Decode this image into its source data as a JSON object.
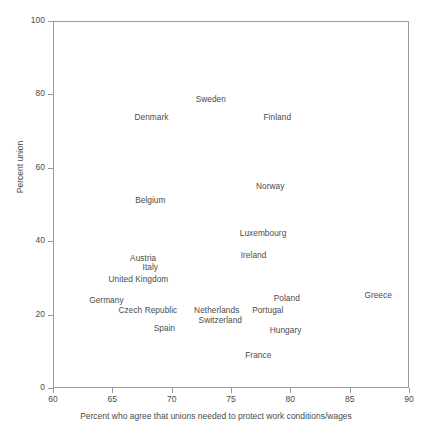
{
  "chart_data": {
    "type": "scatter",
    "title": "",
    "xlabel": "Percent who agree that unions needed to protect work conditions/wages",
    "ylabel": "Percent union",
    "xlim": [
      60,
      90
    ],
    "ylim": [
      0,
      100
    ],
    "xticks": [
      60,
      65,
      70,
      75,
      80,
      85,
      90
    ],
    "yticks": [
      0,
      20,
      40,
      60,
      80,
      100
    ],
    "grid": false,
    "legend": null,
    "marker_style": "text-label-only",
    "points": [
      {
        "label": "Sweden",
        "x": 73.3,
        "y": 78.8
      },
      {
        "label": "Denmark",
        "x": 68.3,
        "y": 73.8
      },
      {
        "label": "Finland",
        "x": 78.9,
        "y": 73.8
      },
      {
        "label": "Norway",
        "x": 78.3,
        "y": 55.0
      },
      {
        "label": "Belgium",
        "x": 68.2,
        "y": 51.2
      },
      {
        "label": "Luxembourg",
        "x": 77.7,
        "y": 42.2
      },
      {
        "label": "Ireland",
        "x": 76.9,
        "y": 36.2
      },
      {
        "label": "Austria",
        "x": 67.6,
        "y": 35.4
      },
      {
        "label": "Italy",
        "x": 68.2,
        "y": 33.0
      },
      {
        "label": "United Kingdom",
        "x": 67.2,
        "y": 29.7
      },
      {
        "label": "Germany",
        "x": 64.5,
        "y": 24.0
      },
      {
        "label": "Poland",
        "x": 79.7,
        "y": 24.5
      },
      {
        "label": "Greece",
        "x": 87.4,
        "y": 25.3
      },
      {
        "label": "Czech Republic",
        "x": 68.0,
        "y": 21.3
      },
      {
        "label": "Netherlands",
        "x": 73.8,
        "y": 21.3
      },
      {
        "label": "Portugal",
        "x": 78.1,
        "y": 21.3
      },
      {
        "label": "Switzerland",
        "x": 74.1,
        "y": 18.5
      },
      {
        "label": "Hungary",
        "x": 79.6,
        "y": 15.8
      },
      {
        "label": "Spain",
        "x": 69.4,
        "y": 16.4
      },
      {
        "label": "France",
        "x": 77.3,
        "y": 9.0
      }
    ]
  },
  "axes": {
    "y_tick_labels": [
      "100",
      "80",
      "60",
      "40",
      "20",
      "0"
    ],
    "y_tick_values": [
      100,
      80,
      60,
      40,
      20,
      0
    ],
    "x_tick_labels": [
      "60",
      "65",
      "70",
      "75",
      "80",
      "85",
      "90"
    ],
    "x_tick_values": [
      60,
      65,
      70,
      75,
      80,
      85,
      90
    ],
    "y_title": "Percent union",
    "x_title": "Percent who agree that unions needed to protect work conditions/wages"
  },
  "colors": {
    "axis": "#9a9a9a",
    "text": "#4a4a4a",
    "background": "#ffffff"
  }
}
